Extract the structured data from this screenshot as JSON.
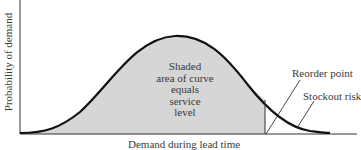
{
  "diagram": {
    "type": "normal-distribution-service-level",
    "y_axis_label": "Probability of demand",
    "x_axis_label": "Demand during lead time",
    "shaded_area_label": [
      "Shaded",
      "area of curve",
      "equals",
      "service",
      "level"
    ],
    "annotations": {
      "reorder_point": "Reorder point",
      "stockout_risk": "Stockout risk"
    },
    "colors": {
      "curve": "#111111",
      "shading": "#d6d6d6",
      "axis": "#333333"
    }
  }
}
